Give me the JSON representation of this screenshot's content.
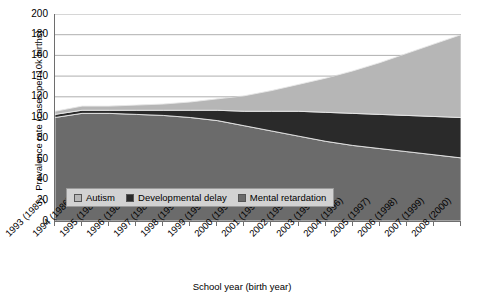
{
  "chart_data": {
    "type": "area",
    "stacked": true,
    "title": "",
    "xlabel": "School year (birth year)",
    "ylabel": "Prevalence rate (cases per 10k births)",
    "ylim": [
      0,
      200
    ],
    "yticks": [
      0,
      20,
      40,
      60,
      80,
      100,
      120,
      140,
      160,
      180,
      200
    ],
    "grid": true,
    "grid_axis": "y",
    "legend_position": "inside-lower-left",
    "categories": [
      "1993 (1985)",
      "1994 (1986)",
      "1995 (1987)",
      "1996 (1988)",
      "1997 (1989)",
      "1998 (1990)",
      "1999 (1991)",
      "2000 (1992)",
      "2001 (1993)",
      "2002 (1994)",
      "2003 (1995)",
      "2004 (1996)",
      "2005 (1997)",
      "2006 (1998)",
      "2007 (1999)",
      "2008 (2000)"
    ],
    "series": [
      {
        "name": "Mental retardation",
        "color": "#6b6b6b",
        "values": [
          100,
          104,
          104,
          103,
          102,
          100,
          97,
          92,
          87,
          82,
          77,
          73,
          70,
          67,
          64,
          61
        ]
      },
      {
        "name": "Developmental delay",
        "color": "#2a2a2a",
        "values": [
          3,
          3,
          3,
          4,
          5,
          7,
          10,
          14,
          19,
          24,
          28,
          31,
          33,
          35,
          37,
          39
        ]
      },
      {
        "name": "Autism",
        "color": "#b6b6b6",
        "values": [
          3,
          4,
          4,
          5,
          6,
          8,
          11,
          15,
          20,
          26,
          33,
          41,
          50,
          60,
          70,
          80
        ]
      }
    ],
    "totals": [
      106,
      111,
      111,
      112,
      113,
      115,
      118,
      121,
      126,
      132,
      138,
      145,
      153,
      162,
      171,
      180
    ]
  },
  "legend": {
    "items": [
      {
        "label": "Autism",
        "icon": "legend-swatch-autism"
      },
      {
        "label": "Developmental delay",
        "icon": "legend-swatch-developmental-delay"
      },
      {
        "label": "Mental retardation",
        "icon": "legend-swatch-mental-retardation"
      }
    ]
  },
  "colors": {
    "autism": "#b6b6b6",
    "developmental_delay": "#2a2a2a",
    "mental_retardation": "#6b6b6b",
    "gridline": "#9a9a9a",
    "axis": "#6e6e6e",
    "legend_background": "#d2d2d2"
  }
}
